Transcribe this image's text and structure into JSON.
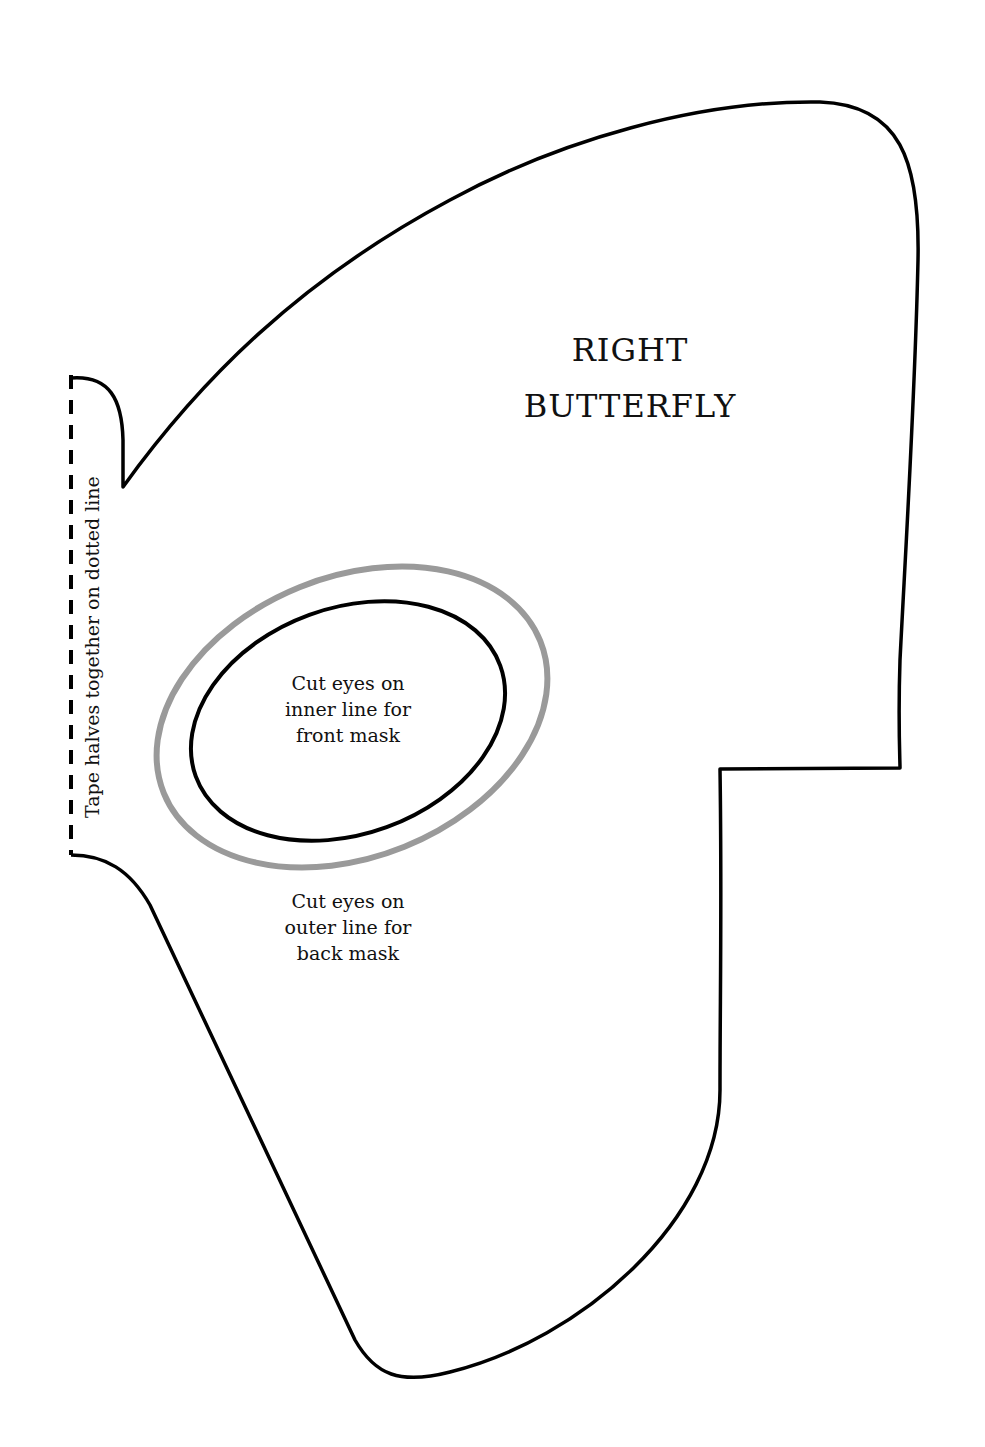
{
  "template": {
    "title_lines": [
      "RIGHT",
      "BUTTERFLY"
    ],
    "inner_eye_note": [
      "Cut eyes on",
      "inner line for",
      "front mask"
    ],
    "outer_eye_note": [
      "Cut eyes on",
      "outer line for",
      "back mask"
    ],
    "fold_note": "Tape  halves together on dotted line"
  },
  "colors": {
    "outline": "#000000",
    "outer_eye_line": "#9a9a9a",
    "background": "#ffffff"
  }
}
